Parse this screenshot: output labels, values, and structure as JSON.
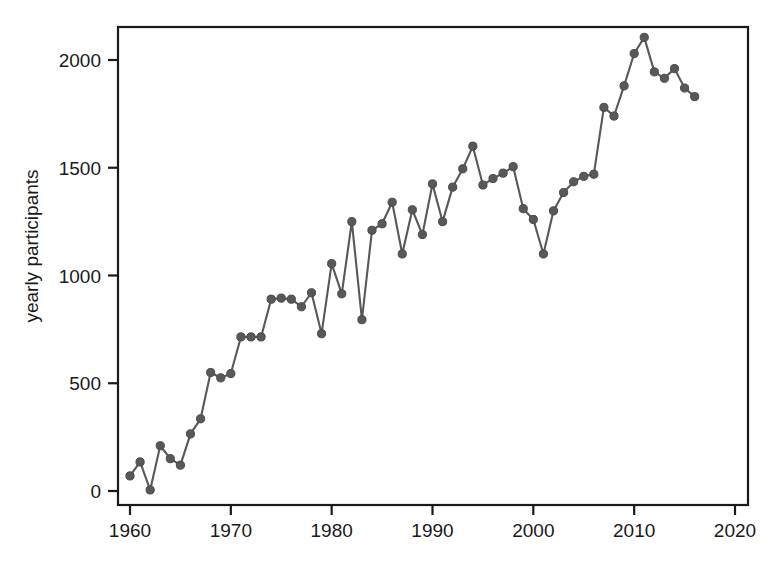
{
  "chart_data": {
    "type": "line",
    "title": "",
    "subtitle": "",
    "xlabel": "",
    "ylabel": "yearly participants",
    "xlim": [
      1960,
      2020
    ],
    "ylim": [
      -95,
      2150
    ],
    "grid": false,
    "legend": null,
    "marker": "filled-circle",
    "line_color": "#585858",
    "marker_color": "#585858",
    "frame_color": "#1a1a1a",
    "background_color": "#ffffff",
    "xticks": [
      1960,
      1970,
      1980,
      1990,
      2000,
      2010,
      2020
    ],
    "xtick_labels": [
      "1960",
      "1970",
      "1980",
      "1990",
      "2000",
      "2010",
      "2020"
    ],
    "yticks": [
      0,
      500,
      1000,
      1500,
      2000
    ],
    "ytick_labels": [
      "0",
      "500",
      "1000",
      "1500",
      "2000"
    ],
    "x": [
      1960,
      1961,
      1962,
      1963,
      1964,
      1965,
      1966,
      1967,
      1968,
      1969,
      1970,
      1971,
      1972,
      1973,
      1974,
      1975,
      1976,
      1977,
      1978,
      1979,
      1980,
      1981,
      1982,
      1983,
      1984,
      1985,
      1986,
      1987,
      1988,
      1989,
      1990,
      1991,
      1992,
      1993,
      1994,
      1995,
      1996,
      1997,
      1998,
      1999,
      2000,
      2001,
      2002,
      2003,
      2004,
      2005,
      2006,
      2007,
      2008,
      2009,
      2010,
      2011,
      2012,
      2013,
      2014,
      2015,
      2016
    ],
    "values": [
      70,
      135,
      5,
      210,
      150,
      120,
      265,
      335,
      550,
      525,
      545,
      715,
      715,
      715,
      890,
      895,
      890,
      855,
      920,
      730,
      1055,
      915,
      1250,
      795,
      1210,
      1240,
      1340,
      1100,
      1305,
      1190,
      1425,
      1250,
      1410,
      1495,
      1600,
      1420,
      1450,
      1475,
      1505,
      1310,
      1260,
      1100,
      1300,
      1385,
      1435,
      1460,
      1470,
      1780,
      1740,
      1880,
      2030,
      2105,
      1945,
      1915,
      1960,
      1870,
      1830
    ],
    "series": [
      {
        "name": "yearly participants",
        "values": [
          70,
          135,
          5,
          210,
          150,
          120,
          265,
          335,
          550,
          525,
          545,
          715,
          715,
          715,
          890,
          895,
          890,
          855,
          920,
          730,
          1055,
          915,
          1250,
          795,
          1210,
          1240,
          1340,
          1100,
          1305,
          1190,
          1425,
          1250,
          1410,
          1495,
          1600,
          1420,
          1450,
          1475,
          1505,
          1310,
          1260,
          1100,
          1300,
          1385,
          1435,
          1460,
          1470,
          1780,
          1740,
          1880,
          2030,
          2105,
          1945,
          1915,
          1960,
          1870,
          1830
        ]
      }
    ]
  }
}
